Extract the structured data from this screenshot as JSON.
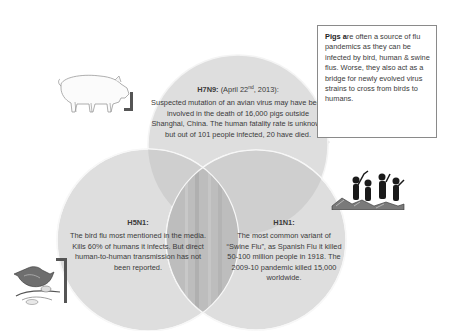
{
  "diagram": {
    "type": "venn",
    "colors": {
      "circle_fill": "#dcdcdc",
      "overlap_fill": "#b8b8b8",
      "circle_edge": "#f4f4f4",
      "box_border": "#8a8a8a",
      "text": "#3a3a3a"
    },
    "circles": [
      {
        "id": "h7n9",
        "title": "H7N9:",
        "title_suffix_pre": " (April 22",
        "title_suffix_sup": "nd",
        "title_suffix_post": ", 2013):",
        "body": "Suspected mutation of an avian virus may have been involved in the death of 16,000 pigs outside Shanghai, China. The human fatality rate is unknown but out of 101 people infected, 20 have died."
      },
      {
        "id": "h5n1",
        "title": "H5N1:",
        "body": "The bird flu most mentioned in the media. Kills 60% of humans it infects. But direct human-to-human transmission has not been reported."
      },
      {
        "id": "h1n1",
        "title": "H1N1:",
        "body": "The most common variant of “Swine Flu”, as Spanish Flu it killed 50-100 million people in 1918. The 2009-10 pandemic killed 15,000 worldwide."
      }
    ],
    "info_box": {
      "bold_lead": "Pigs a",
      "text": "re often a source of flu pandemics as they can be infected by bird, human & swine flus. Worse, they also act as a bridge for newly evolved virus strains to cross from birds to humans."
    },
    "illustrations": {
      "top": "pig-icon",
      "left": "bird-icon",
      "right": "people-icon"
    }
  }
}
